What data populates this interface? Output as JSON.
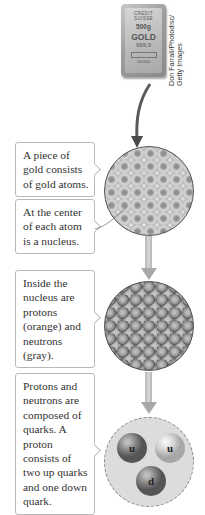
{
  "figure": {
    "photo": {
      "subject": "gold bar",
      "bar_text": {
        "brand_line1": "CREDIT",
        "brand_line2": "SUISSE",
        "weight": "500g",
        "metal": "GOLD",
        "purity": "999,9",
        "serial": "100300"
      },
      "credit": "Don Farrall/Photodisc/ Getty Images"
    },
    "steps": [
      {
        "id": "atoms",
        "label": "A piece of gold consists of gold atoms."
      },
      {
        "id": "nucleus-center",
        "label": "At the center of each atom is a nucleus."
      },
      {
        "id": "nucleons",
        "label": "Inside the nucleus are protons (orange) and neutrons (gray)."
      },
      {
        "id": "quarks",
        "label": "Protons and neutrons are composed of quarks. A proton consists of two up quarks and one down quark."
      }
    ],
    "quarks": [
      {
        "symbol": "u",
        "name": "up quark",
        "shade": "dark"
      },
      {
        "symbol": "u",
        "name": "up quark",
        "shade": "light"
      },
      {
        "symbol": "d",
        "name": "down quark",
        "shade": "dark"
      }
    ],
    "colors": {
      "callout_border": "#b9b9b9",
      "arrow": "#a8a8a8",
      "circle_outline": "#555555",
      "text": "#333333"
    }
  }
}
